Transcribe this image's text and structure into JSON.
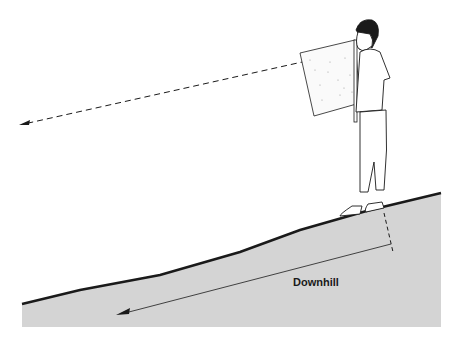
{
  "diagram": {
    "label": "Downhill",
    "colors": {
      "ground": "#d4d4d4",
      "line": "#1a1a1a",
      "background": "#ffffff"
    },
    "elements": [
      "person-with-sighting-board",
      "dashed-sight-line",
      "sloped-ground",
      "downhill-arrow"
    ]
  }
}
